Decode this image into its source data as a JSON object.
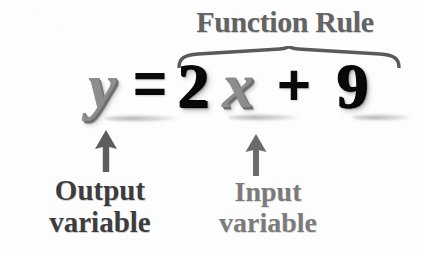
{
  "figure": {
    "title": "Function Rule",
    "equation": {
      "output_variable": "y",
      "equals": "=",
      "coefficient": "2",
      "input_variable": "x",
      "plus": "+",
      "constant": "9",
      "full_text": "y = 2x + 9"
    },
    "brace": {
      "name": "function-rule-brace",
      "covers": "2x + 9"
    },
    "annotations": [
      {
        "arrow": "up-arrow",
        "points_to": "y",
        "label_line1": "Output",
        "label_line2": "variable"
      },
      {
        "arrow": "up-arrow",
        "points_to": "x",
        "label_line1": "Input",
        "label_line2": "variable"
      }
    ],
    "colors": {
      "background": "#fdfdfd",
      "title_gray": "#636363",
      "variable_gray": "#8d8d8d",
      "numeral_black": "#090909",
      "output_label": "#3d3d3d",
      "input_label": "#7b7b7b",
      "arrow_gray": "#5d5d5d",
      "brace_gray": "#5a5a5a"
    }
  }
}
